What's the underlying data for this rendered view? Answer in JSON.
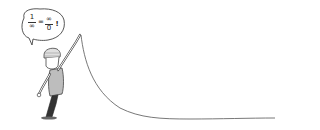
{
  "illustration": {
    "subject": "cartoon-man-pointing-up-holding-curve",
    "speech_bubble": {
      "lhs_numerator": "1",
      "lhs_denominator": "∞",
      "equals": "=",
      "rhs_numerator": "∞",
      "rhs_denominator": "0",
      "exclamation": "!"
    },
    "colors": {
      "line": "#555555",
      "shirt": "#bdbdbd",
      "pants": "#333333",
      "background": "#ffffff"
    }
  }
}
